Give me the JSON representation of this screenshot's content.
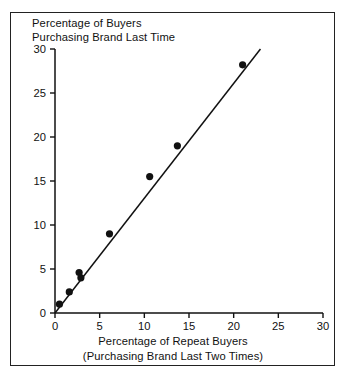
{
  "figure": {
    "border_color": "#222222",
    "background": "#ffffff",
    "ink_color": "#111111"
  },
  "title_lines": [
    "Percentage of Buyers",
    "Purchasing Brand Last Time"
  ],
  "xlabel_lines": [
    "Percentage of Repeat Buyers",
    "(Purchasing Brand Last Two Times)"
  ],
  "axes": {
    "x_ticks": [
      "0",
      "5",
      "10",
      "15",
      "20",
      "25",
      "30"
    ],
    "y_ticks": [
      "0",
      "5",
      "10",
      "15",
      "20",
      "25",
      "30"
    ]
  },
  "chart_data": {
    "type": "scatter",
    "title": "Percentage of Buyers Purchasing Brand Last Time",
    "xlabel": "Percentage of Repeat Buyers (Purchasing Brand Last Two Times)",
    "ylabel": "Percentage of Buyers Purchasing Brand Last Time",
    "xlim": [
      0,
      30
    ],
    "ylim": [
      0,
      30
    ],
    "xticks": [
      0,
      5,
      10,
      15,
      20,
      25,
      30
    ],
    "yticks": [
      0,
      5,
      10,
      15,
      20,
      25,
      30
    ],
    "grid": false,
    "legend": false,
    "marker": "filled-circle",
    "points": [
      {
        "x": 0.5,
        "y": 1.0
      },
      {
        "x": 1.6,
        "y": 2.4
      },
      {
        "x": 2.7,
        "y": 4.6
      },
      {
        "x": 2.9,
        "y": 4.0
      },
      {
        "x": 6.1,
        "y": 9.0
      },
      {
        "x": 10.6,
        "y": 15.5
      },
      {
        "x": 13.7,
        "y": 19.0
      },
      {
        "x": 21.0,
        "y": 28.2
      }
    ],
    "fit_line": {
      "type": "line",
      "x": [
        0.0,
        23.0
      ],
      "y": [
        0.0,
        30.0
      ]
    }
  }
}
